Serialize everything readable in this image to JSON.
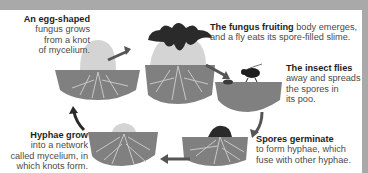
{
  "colors": {
    "frame": "#a9a9a9",
    "soil": "#808080",
    "egg": "#d4d4d4",
    "fungus_dark": "#2a2a2a",
    "hyphae": "#c8c8c8",
    "arrow": "#555555"
  },
  "stages": [
    {
      "id": "egg",
      "bold": "An egg-shaped",
      "lines": [
        "fungus grows",
        "from a knot",
        "of mycelium."
      ]
    },
    {
      "id": "fruiting",
      "bold": "The fungus fruiting",
      "rest_first": " body emerges,",
      "lines": [
        "and a fly eats its spore-filled slime."
      ]
    },
    {
      "id": "fly",
      "bold": "The insect flies",
      "lines": [
        "away and spreads",
        "the spores in",
        "its poo."
      ]
    },
    {
      "id": "germinate",
      "bold": "Spores germinate",
      "lines": [
        "to form hyphae, which",
        "fuse with other hyphae."
      ]
    },
    {
      "id": "hyphae",
      "bold": "Hyphae grow",
      "lines": [
        "into a network",
        "called mycelium, in",
        "which knots form."
      ]
    }
  ]
}
